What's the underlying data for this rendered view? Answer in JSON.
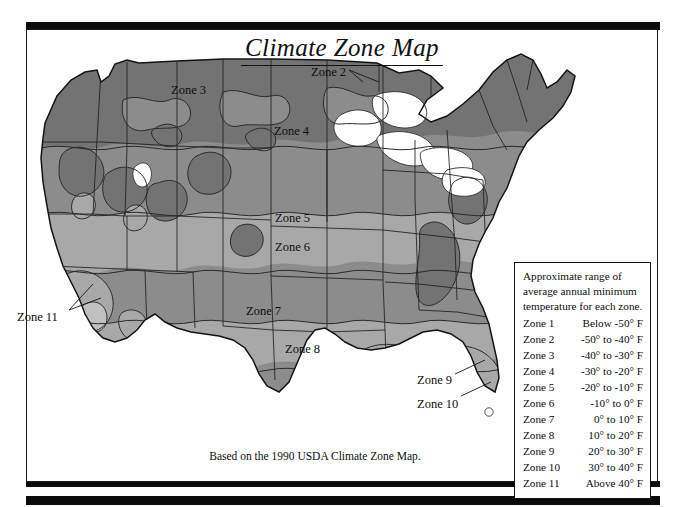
{
  "title": "Climate Zone Map",
  "caption": "Based on the 1990 USDA Climate Zone Map.",
  "colors": {
    "ink": "#0d0d0d",
    "frame": "#1a1a1a",
    "paper": "#ffffff",
    "zone_dark": "#737373",
    "zone_mid": "#8c8c8c",
    "zone_light": "#a8a8a8",
    "zone_lightest": "#c0c0c0",
    "outline": "#2b2b2b"
  },
  "map_labels": [
    {
      "name": "Zone 2",
      "x": 284,
      "y": 36,
      "leader": true
    },
    {
      "name": "Zone 3",
      "x": 144,
      "y": 54,
      "leader": false
    },
    {
      "name": "Zone 4",
      "x": 247,
      "y": 95,
      "leader": false
    },
    {
      "name": "Zone 5",
      "x": 248,
      "y": 182,
      "leader": false
    },
    {
      "name": "Zone 6",
      "x": 248,
      "y": 211,
      "leader": false
    },
    {
      "name": "Zone 7",
      "x": 219,
      "y": 275,
      "leader": false
    },
    {
      "name": "Zone 8",
      "x": 258,
      "y": 313,
      "leader": false
    },
    {
      "name": "Zone 9",
      "x": 390,
      "y": 344,
      "leader": true
    },
    {
      "name": "Zone 10",
      "x": 390,
      "y": 368,
      "leader": true
    },
    {
      "name": "Zone 11",
      "x": -10,
      "y": 281,
      "leader": true
    }
  ],
  "legend": {
    "heading_lines": [
      "Approximate range of",
      "average annual minimum",
      "temperature for each zone."
    ],
    "rows": [
      {
        "zone": "Zone 1",
        "range": "Below -50° F"
      },
      {
        "zone": "Zone 2",
        "range": "-50° to -40° F"
      },
      {
        "zone": "Zone 3",
        "range": "-40° to -30° F"
      },
      {
        "zone": "Zone 4",
        "range": "-30° to -20° F"
      },
      {
        "zone": "Zone 5",
        "range": "-20° to -10° F"
      },
      {
        "zone": "Zone 6",
        "range": "-10° to   0° F"
      },
      {
        "zone": "Zone 7",
        "range": "0° to  10° F"
      },
      {
        "zone": "Zone 8",
        "range": "10° to  20° F"
      },
      {
        "zone": "Zone 9",
        "range": "20° to  30° F"
      },
      {
        "zone": "Zone 10",
        "range": "30° to  40° F"
      },
      {
        "zone": "Zone 11",
        "range": "Above 40° F"
      }
    ]
  }
}
